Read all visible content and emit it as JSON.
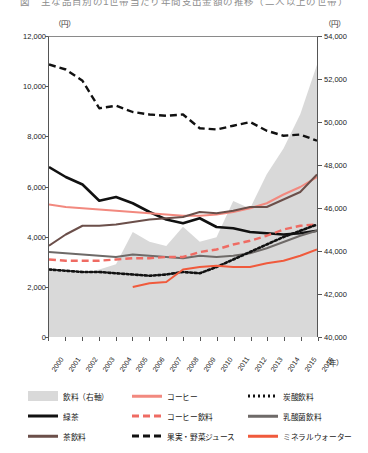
{
  "title": "図　主な品目別の1世帯当たり年間支出金額の推移（二人以上の世帯）",
  "axes": {
    "left_unit": "（円）",
    "right_unit": "（円）",
    "x_unit": "（年）",
    "left_ticks": [
      "12,000",
      "10,000",
      "8,000",
      "6,000",
      "4,000",
      "2,000",
      "0"
    ],
    "right_ticks": [
      "54,000",
      "52,000",
      "50,000",
      "48,000",
      "46,000",
      "44,000",
      "42,000",
      "40,000"
    ],
    "x_ticks": [
      "2000",
      "2001",
      "2002",
      "2003",
      "2004",
      "2005",
      "2006",
      "2007",
      "2008",
      "2009",
      "2010",
      "2011",
      "2012",
      "2013",
      "2014",
      "2015",
      "2016"
    ]
  },
  "legend": {
    "items": [
      {
        "label": "飲料（右軸）",
        "style": "area",
        "color": "#d9d9d9"
      },
      {
        "label": "コーヒー",
        "style": "solid",
        "color": "#f2897f"
      },
      {
        "label": "炭酸飲料",
        "style": "dotted",
        "color": "#111111"
      },
      {
        "label": "緑茶",
        "style": "solid-thick",
        "color": "#111111"
      },
      {
        "label": "コーヒー飲料",
        "style": "dashed",
        "color": "#ef6b63"
      },
      {
        "label": "乳酸菌飲料",
        "style": "solid",
        "color": "#6e6a68"
      },
      {
        "label": "茶飲料",
        "style": "solid",
        "color": "#6b4f4a"
      },
      {
        "label": "果実・野菜ジュース",
        "style": "dashed",
        "color": "#111111"
      },
      {
        "label": "ミネラルウォーター",
        "style": "solid",
        "color": "#f05a3c"
      }
    ]
  },
  "chart_data": {
    "type": "line",
    "title": "図　主な品目別の1世帯当たり年間支出金額の推移（二人以上の世帯）",
    "xlabel": "（年）",
    "ylabel": "（円）",
    "y2label": "（円）",
    "x": [
      2000,
      2001,
      2002,
      2003,
      2004,
      2005,
      2006,
      2007,
      2008,
      2009,
      2010,
      2011,
      2012,
      2013,
      2014,
      2015,
      2016
    ],
    "ylim": [
      0,
      12000
    ],
    "y2lim": [
      40000,
      54000
    ],
    "grid": false,
    "legend_position": "below",
    "series": [
      {
        "name": "飲料（右軸）",
        "style": "area",
        "axis": "right",
        "color": "#d9d9d9",
        "values": [
          43100,
          43050,
          43000,
          43150,
          43400,
          44900,
          44450,
          44250,
          45150,
          44450,
          44650,
          46350,
          46000,
          47600,
          48800,
          50400,
          52700
        ]
      },
      {
        "name": "果実・野菜ジュース",
        "style": "dashed",
        "axis": "left",
        "color": "#111111",
        "values": [
          10900,
          10700,
          10250,
          9150,
          9250,
          9000,
          8900,
          8850,
          8900,
          8350,
          8300,
          8450,
          8600,
          8250,
          8050,
          8100,
          7850
        ]
      },
      {
        "name": "緑茶",
        "style": "solid-thick",
        "axis": "left",
        "color": "#111111",
        "values": [
          6800,
          6400,
          6100,
          5450,
          5600,
          5350,
          5000,
          4700,
          4550,
          4750,
          4400,
          4350,
          4200,
          4150,
          4100,
          4150,
          4250
        ]
      },
      {
        "name": "コーヒー",
        "style": "solid",
        "axis": "left",
        "color": "#f2897f",
        "values": [
          5300,
          5200,
          5150,
          5100,
          5050,
          5000,
          4950,
          4900,
          4850,
          4850,
          4900,
          5000,
          5150,
          5350,
          5700,
          6000,
          6400
        ]
      },
      {
        "name": "茶飲料",
        "style": "solid",
        "axis": "left",
        "color": "#6b4f4a",
        "values": [
          3650,
          4100,
          4450,
          4450,
          4500,
          4600,
          4700,
          4750,
          4800,
          5000,
          4950,
          5050,
          5200,
          5200,
          5500,
          5800,
          6500
        ]
      },
      {
        "name": "乳酸菌飲料",
        "style": "solid",
        "axis": "left",
        "color": "#6e6a68",
        "values": [
          3400,
          3350,
          3300,
          3250,
          3200,
          3300,
          3250,
          3200,
          3150,
          3250,
          3200,
          3250,
          3350,
          3550,
          3800,
          4050,
          4250
        ]
      },
      {
        "name": "コーヒー飲料",
        "style": "dashed",
        "axis": "left",
        "color": "#ef6b63",
        "values": [
          3100,
          3050,
          3050,
          3050,
          3100,
          3150,
          3150,
          3200,
          3200,
          3400,
          3500,
          3700,
          3850,
          4050,
          4300,
          4450,
          4500
        ]
      },
      {
        "name": "炭酸飲料",
        "style": "dotted",
        "axis": "left",
        "color": "#111111",
        "values": [
          2700,
          2650,
          2600,
          2600,
          2550,
          2500,
          2450,
          2500,
          2600,
          2550,
          2800,
          3100,
          3400,
          3700,
          4000,
          4250,
          4500
        ]
      },
      {
        "name": "ミネラルウォーター",
        "style": "solid",
        "axis": "left",
        "color": "#f05a3c",
        "start_year": 2005,
        "values": [
          null,
          null,
          null,
          null,
          null,
          2000,
          2150,
          2200,
          2700,
          2800,
          2850,
          2800,
          2800,
          2950,
          3050,
          3250,
          3500
        ]
      }
    ]
  }
}
